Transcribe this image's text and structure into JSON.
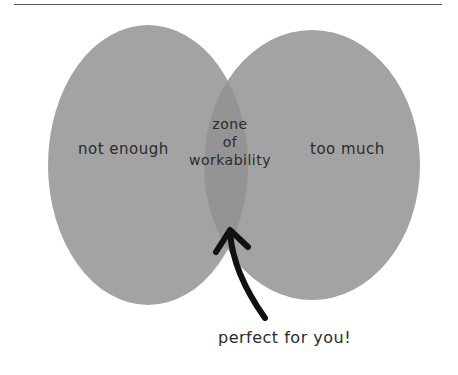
{
  "diagram": {
    "type": "venn",
    "sets": [
      {
        "id": "left",
        "label": "not enough"
      },
      {
        "id": "right",
        "label": "too much"
      }
    ],
    "intersection": {
      "label_lines": [
        "zone",
        "of",
        "workability"
      ]
    },
    "annotation": {
      "text": "perfect for you!",
      "points_to": "intersection"
    },
    "colors": {
      "circle": "#a3a3a3",
      "overlap": "#959595",
      "arrow": "#111111",
      "text": "#2b2b2b"
    }
  }
}
